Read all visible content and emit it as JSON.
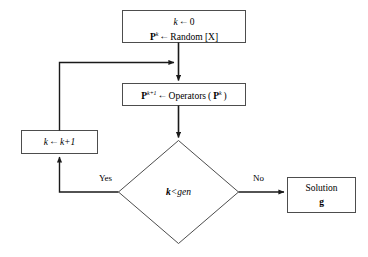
{
  "diagram": {
    "type": "flowchart",
    "colors": {
      "stroke": "#4d4d4d",
      "arrow": "#1a1a1a",
      "background": "#ffffff",
      "text": "#000000"
    }
  },
  "nodes": {
    "init": {
      "shape": "rectangle",
      "line1_var": "k",
      "line1_arrow": "←",
      "line1_value": "0",
      "line2_var": "P",
      "line2_var_sup": "k",
      "line2_arrow": "←",
      "line2_value": "Random [X]"
    },
    "operators": {
      "shape": "rectangle",
      "lhs_var": "P",
      "lhs_sup": "k+1",
      "arrow": "←",
      "rhs_fn": "Operators",
      "rhs_open": "(",
      "rhs_arg": "P",
      "rhs_arg_sup": "k",
      "rhs_close": ")"
    },
    "increment": {
      "shape": "rectangle",
      "lhs": "k",
      "arrow": "←",
      "rhs": "k+1"
    },
    "condition": {
      "shape": "diamond",
      "lhs": "k",
      "op": "<",
      "rhs": "gen"
    },
    "solution": {
      "shape": "rectangle",
      "line1": "Solution",
      "line2": "g"
    }
  },
  "edges": {
    "yes_label": "Yes",
    "no_label": "No"
  }
}
